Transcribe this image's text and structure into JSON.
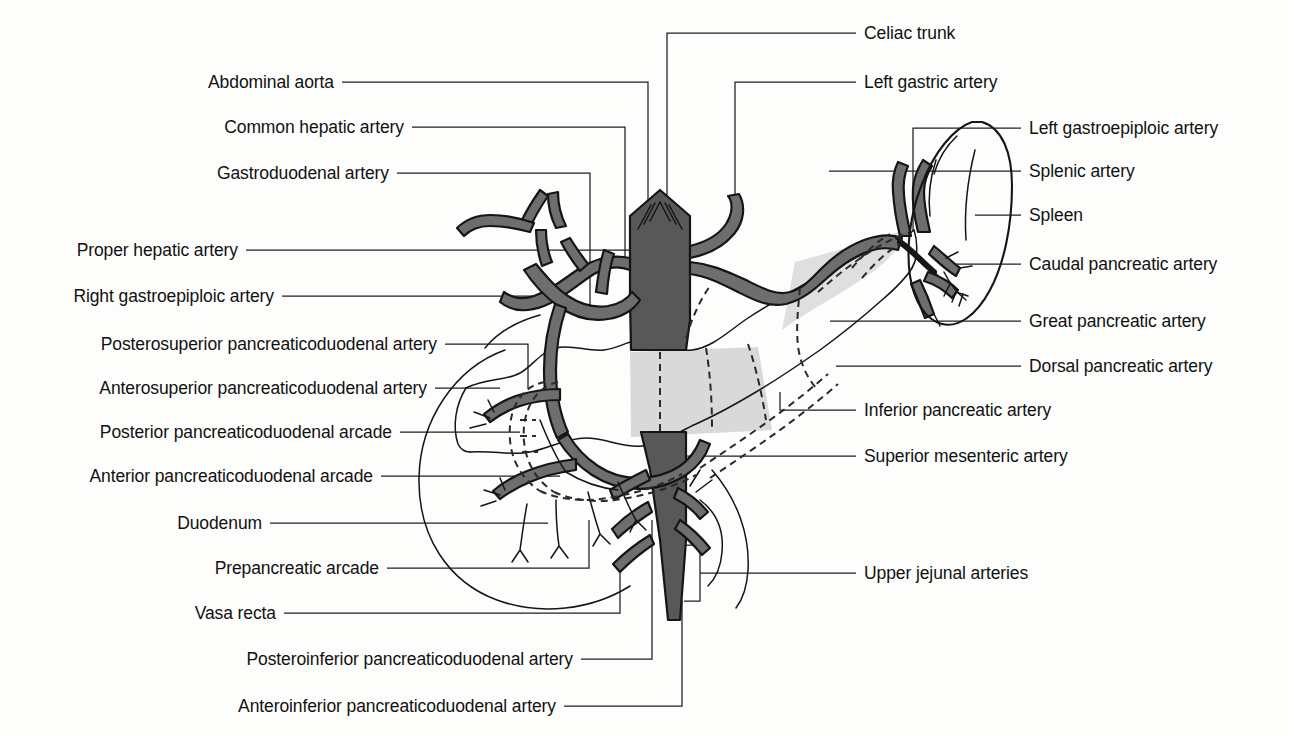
{
  "figure": {
    "type": "anatomical-line-diagram",
    "width": 1289,
    "height": 736,
    "colors": {
      "background": "#fdfdfc",
      "ink": "#1a1a1a",
      "artery_fill": "#6e6e6e",
      "aorta_fill": "#5c5c5c",
      "pancreas_shade": "#d9d9d9",
      "leader_line": "#1f1f1f"
    }
  },
  "labels_left": [
    {
      "id": "abdominal-aorta",
      "text": "Abdominal aorta",
      "text_x": 334,
      "text_y": 82,
      "elbow_x": 648,
      "target_x": 648,
      "target_y": 214
    },
    {
      "id": "common-hepatic-artery",
      "text": "Common hepatic artery",
      "text_x": 404,
      "text_y": 127,
      "elbow_x": 625,
      "target_x": 625,
      "target_y": 268
    },
    {
      "id": "gastroduodenal-artery",
      "text": "Gastroduodenal artery",
      "text_x": 389,
      "text_y": 173,
      "elbow_x": 590,
      "target_x": 590,
      "target_y": 318
    },
    {
      "id": "proper-hepatic-artery",
      "text": "Proper hepatic artery",
      "text_x": 238,
      "text_y": 250,
      "elbow_x": 648,
      "target_x": 648,
      "target_y": 250
    },
    {
      "id": "right-gastroepiploic-artery",
      "text": "Right gastroepiploic artery",
      "text_x": 274,
      "text_y": 296,
      "elbow_x": 556,
      "target_x": 556,
      "target_y": 330
    },
    {
      "id": "posterosuperior-pancreaticoduodenal-artery",
      "text": "Posterosuperior pancreaticoduodenal artery",
      "text_x": 437,
      "text_y": 344,
      "elbow_x": 528,
      "target_x": 528,
      "target_y": 388
    },
    {
      "id": "anterosuperior-pancreaticoduodenal-artery",
      "text": "Anterosuperior pancreaticoduodenal artery",
      "text_x": 427,
      "text_y": 388,
      "elbow_x": 500,
      "target_x": 500,
      "target_y": 400
    },
    {
      "id": "posterior-pancreaticoduodenal-arcade",
      "text": "Posterior pancreaticoduodenal arcade",
      "text_x": 392,
      "text_y": 432,
      "elbow_x": 520,
      "target_x": 520,
      "target_y": 432
    },
    {
      "id": "anterior-pancreaticoduodenal-arcade",
      "text": "Anterior pancreaticoduodenal arcade",
      "text_x": 373,
      "text_y": 476,
      "elbow_x": 560,
      "target_x": 560,
      "target_y": 476
    },
    {
      "id": "duodenum",
      "text": "Duodenum",
      "text_x": 262,
      "text_y": 523,
      "elbow_x": 548,
      "target_x": 548,
      "target_y": 523
    },
    {
      "id": "prepancreatic-arcade",
      "text": "Prepancreatic arcade",
      "text_x": 379,
      "text_y": 568,
      "elbow_x": 589,
      "target_x": 589,
      "target_y": 568
    },
    {
      "id": "vasa-recta",
      "text": "Vasa recta",
      "text_x": 276,
      "text_y": 613,
      "elbow_x": 620,
      "target_x": 620,
      "target_y": 613
    },
    {
      "id": "posteroinferior-pancreaticoduodenal-artery",
      "text": "Posteroinferior pancreaticoduodenal artery",
      "text_x": 573,
      "text_y": 659,
      "elbow_x": 652,
      "target_x": 652,
      "target_y": 659
    },
    {
      "id": "anteroinferior-pancreaticoduodenal-artery",
      "text": "Anteroinferior pancreaticoduodenal artery",
      "text_x": 556,
      "text_y": 706,
      "elbow_x": 682,
      "target_x": 682,
      "target_y": 706
    }
  ],
  "labels_right": [
    {
      "id": "celiac-trunk",
      "text": "Celiac trunk",
      "text_x": 864,
      "text_y": 33,
      "elbow_x": 667,
      "target_x": 667,
      "target_y": 215
    },
    {
      "id": "left-gastric-artery",
      "text": "Left gastric artery",
      "text_x": 864,
      "text_y": 82,
      "elbow_x": 735,
      "target_x": 735,
      "target_y": 228
    },
    {
      "id": "left-gastroepiploic-artery",
      "text": "Left gastroepiploic artery",
      "text_x": 1029,
      "text_y": 128,
      "elbow_x": 913,
      "target_x": 913,
      "target_y": 232
    },
    {
      "id": "splenic-artery",
      "text": "Splenic artery",
      "text_x": 1029,
      "text_y": 171,
      "elbow_x": 829,
      "target_x": 829,
      "target_y": 171
    },
    {
      "id": "spleen",
      "text": "Spleen",
      "text_x": 1029,
      "text_y": 215,
      "elbow_x": 975,
      "target_x": 975,
      "target_y": 215
    },
    {
      "id": "caudal-pancreatic-artery",
      "text": "Caudal pancreatic artery",
      "text_x": 1029,
      "text_y": 264,
      "elbow_x": 950,
      "target_x": 950,
      "target_y": 264
    },
    {
      "id": "great-pancreatic-artery",
      "text": "Great pancreatic artery",
      "text_x": 1029,
      "text_y": 321,
      "elbow_x": 830,
      "target_x": 830,
      "target_y": 321
    },
    {
      "id": "dorsal-pancreatic-artery",
      "text": "Dorsal pancreatic artery",
      "text_x": 1029,
      "text_y": 366,
      "elbow_x": 836,
      "target_x": 836,
      "target_y": 366
    },
    {
      "id": "inferior-pancreatic-artery",
      "text": "Inferior pancreatic artery",
      "text_x": 864,
      "text_y": 410,
      "elbow_x": 780,
      "target_x": 780,
      "target_y": 410
    },
    {
      "id": "superior-mesenteric-artery",
      "text": "Superior mesenteric artery",
      "text_x": 864,
      "text_y": 456,
      "elbow_x": 660,
      "target_x": 660,
      "target_y": 456
    },
    {
      "id": "upper-jejunal-arteries",
      "text": "Upper jejunal arteries",
      "text_x": 864,
      "text_y": 573,
      "elbow_x": 684,
      "target_x": 684,
      "target_y": 573
    }
  ],
  "structures": [
    {
      "id": "abdominal-aorta",
      "name": "Abdominal aorta",
      "shading": "dark-gray"
    },
    {
      "id": "celiac-trunk",
      "name": "Celiac trunk",
      "shading": "dark-gray"
    },
    {
      "id": "splenic-artery",
      "name": "Splenic artery",
      "shading": "dark-gray"
    },
    {
      "id": "common-hepatic",
      "name": "Common hepatic artery",
      "shading": "dark-gray"
    },
    {
      "id": "superior-mesenteric",
      "name": "Superior mesenteric artery",
      "shading": "dark-gray"
    },
    {
      "id": "pancreas",
      "name": "Pancreas",
      "shading": "light-gray-outline"
    },
    {
      "id": "duodenum",
      "name": "Duodenum (C-loop)",
      "shading": "outline"
    },
    {
      "id": "spleen",
      "name": "Spleen",
      "shading": "outline"
    },
    {
      "id": "posterior-arcade",
      "name": "Posterior arcade (hidden)",
      "shading": "dashed"
    },
    {
      "id": "dorsal-inferior",
      "name": "Dorsal / inferior pancreatic",
      "shading": "dashed"
    }
  ]
}
